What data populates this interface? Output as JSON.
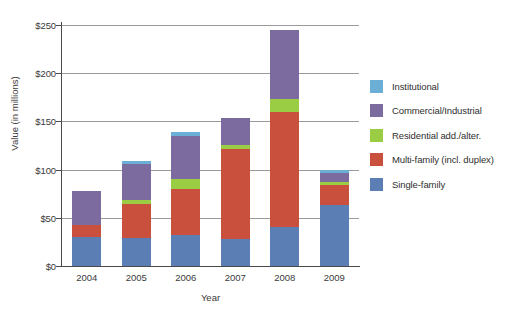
{
  "chart_data": {
    "type": "bar",
    "stacked": true,
    "title": "",
    "xlabel": "Year",
    "ylabel": "Value (in millions)",
    "categories": [
      "2004",
      "2005",
      "2006",
      "2007",
      "2008",
      "2009"
    ],
    "ylim": [
      0,
      250
    ],
    "ytick_values": [
      0,
      50,
      100,
      150,
      200,
      250
    ],
    "ytick_labels": [
      "$0",
      "$50",
      "$100",
      "$150",
      "$200",
      "$250"
    ],
    "grid": true,
    "legend_position": "right",
    "series": [
      {
        "name": "Single-family",
        "color": "#5b7fb4",
        "values": [
          30,
          29,
          32,
          28,
          40,
          63
        ]
      },
      {
        "name": "Multi-family (incl. duplex)",
        "color": "#c8503c",
        "values": [
          13,
          35,
          48,
          93,
          120,
          21
        ]
      },
      {
        "name": "Residential add./alter.",
        "color": "#9acd43",
        "values": [
          0,
          4,
          10,
          5,
          13,
          3
        ]
      },
      {
        "name": "Commercial/Industrial",
        "color": "#7b6b9e",
        "values": [
          35,
          38,
          45,
          28,
          72,
          9
        ]
      },
      {
        "name": "Institutional",
        "color": "#6baed6",
        "values": [
          0,
          3,
          4,
          0,
          0,
          4
        ]
      }
    ],
    "totals": [
      78,
      109,
      139,
      154,
      245,
      100
    ]
  },
  "legend": {
    "items": [
      {
        "label": "Institutional",
        "color": "#6baed6"
      },
      {
        "label": "Commercial/Industrial",
        "color": "#7b6b9e"
      },
      {
        "label": "Residential add./alter.",
        "color": "#9acd43"
      },
      {
        "label": "Multi-family (incl. duplex)",
        "color": "#c8503c"
      },
      {
        "label": "Single-family",
        "color": "#5b7fb4"
      }
    ]
  }
}
